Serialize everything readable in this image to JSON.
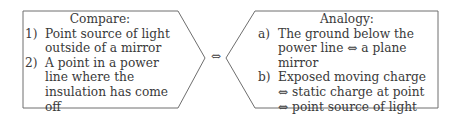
{
  "compare_box": {
    "title": "Compare:",
    "items": [
      {
        "marker": "1)",
        "text": "Point source of light outside of a mirror"
      },
      {
        "marker": "2)",
        "text": "A point in a power line where the insulation has come off"
      }
    ]
  },
  "connector": {
    "symbol": "⇔",
    "icon": "double-arrow-icon"
  },
  "analogy_box": {
    "title": "Analogy:",
    "items": [
      {
        "marker": "a)",
        "text": "The ground below the power line ⇔ a plane mirror"
      },
      {
        "marker": "b)",
        "text": "Exposed moving charge ⇔ static charge at point ⇔ point source of light"
      }
    ]
  },
  "colors": {
    "stroke": "#6e6e6e",
    "text": "#3a3a3a"
  }
}
